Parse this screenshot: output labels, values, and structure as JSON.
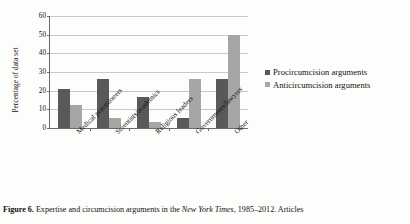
{
  "chart_data": {
    "type": "bar",
    "title": "",
    "xlabel": "",
    "ylabel": "Percentage of data set",
    "ylim": [
      0,
      60
    ],
    "ytick_step": 10,
    "yticks": [
      60,
      50,
      40,
      30,
      20,
      10,
      0
    ],
    "grid": true,
    "legend_position": "right",
    "categories": [
      "Medical practitioners",
      "Scientists/academics",
      "Religious leaders",
      "Governments/lawyers",
      "Other"
    ],
    "series": [
      {
        "name": "Procircumcision arguments",
        "color": "#595959",
        "values": [
          21,
          26.5,
          16.5,
          5.5,
          26.5
        ]
      },
      {
        "name": "Anticircumcision arguments",
        "color": "#a6a6a6",
        "values": [
          12.5,
          5.5,
          3,
          26.5,
          50
        ]
      }
    ]
  },
  "caption": {
    "label": "Figure 6.",
    "text_before_italic": " Expertise and circumcision arguments in the ",
    "italic": "New York Times",
    "text_after_italic": ", 1985–2012. Articles"
  }
}
